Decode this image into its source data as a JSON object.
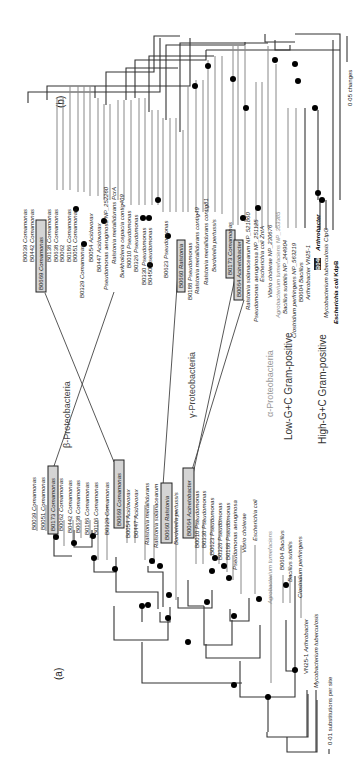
{
  "figure": {
    "panel_a_label": "(a)",
    "panel_b_label": "(b)",
    "scale_a": "0·01 substitutions per site",
    "scale_b": "0·05 changes",
    "groups": {
      "beta": "β-Proteobacteria",
      "gamma": "γ-Proteobacteria",
      "alpha": "α-Proteobacteria",
      "low_gc": "Low-G+C Gram-positive",
      "high_gc": "High-G+C Gram-positive"
    }
  },
  "tree_a": {
    "taxa": [
      {
        "id": "B0039",
        "name": "Comamonas"
      },
      {
        "id": "B0051",
        "name": "Comamonas"
      },
      {
        "id": "B0173",
        "name": "Comamonas",
        "highlight": true
      },
      {
        "id": "B0062",
        "name": "Comamonas"
      },
      {
        "id": "B0442",
        "name": "Comamonas"
      },
      {
        "id": "B0638",
        "name": "Comamonas"
      },
      {
        "id": "B0186",
        "name": "Comamonas"
      },
      {
        "id": "B0106",
        "name": "Comamonas"
      },
      {
        "id": "B0329",
        "name": "Comamonas"
      },
      {
        "id": "B0669",
        "name": "Comamonas",
        "highlight": true
      },
      {
        "id": "B0054",
        "name": "Acidovorax"
      },
      {
        "id": "B0447",
        "name": "Acidovorax"
      },
      {
        "id": "",
        "name": "Ralstonia metallidurans"
      },
      {
        "id": "",
        "name": "Ralstonia solanacearum"
      },
      {
        "id": "B0660",
        "name": "Ralstonia",
        "highlight": true
      },
      {
        "id": "",
        "name": "Bordetella pertussis"
      },
      {
        "id": "B0064",
        "name": "Acinetobacter",
        "highlight": true
      },
      {
        "id": "B0010",
        "name": "Pseudomonas"
      },
      {
        "id": "B0330",
        "name": "Pseudomonas"
      },
      {
        "id": "B0623",
        "name": "Pseudomonas"
      },
      {
        "id": "B0326",
        "name": "Pseudomonas"
      },
      {
        "id": "B0188",
        "name": "Pseudomonas"
      },
      {
        "id": "",
        "name": "Pseudomonas aeruginosa"
      },
      {
        "id": "",
        "name": "Vibrio cholerae"
      },
      {
        "id": "",
        "name": "Escherichia coli"
      },
      {
        "id": "",
        "name": "Agrobacterium tumefaciens",
        "gray": true
      },
      {
        "id": "B0604",
        "name": "Bacillus"
      },
      {
        "id": "",
        "name": "Bacillus subtilis"
      },
      {
        "id": "",
        "name": "Clostridium perfringens"
      },
      {
        "id": "VN25-1",
        "name": "Arthrobacter"
      },
      {
        "id": "",
        "name": "Mycobacterium tuberculosis"
      }
    ]
  },
  "tree_b": {
    "taxa": [
      {
        "id": "B0039",
        "name": "Comamonas"
      },
      {
        "id": "B0442",
        "name": "Comamonas"
      },
      {
        "id": "B0669",
        "name": "Comamonas",
        "highlight": true
      },
      {
        "id": "B0138",
        "name": "Comamonas"
      },
      {
        "id": "B0638",
        "name": "Comamonas"
      },
      {
        "id": "B0062",
        "name": "Comamonas"
      },
      {
        "id": "B0186",
        "name": "Comamonas"
      },
      {
        "id": "B0051",
        "name": "Comamonas"
      },
      {
        "id": "B0329",
        "name": "Comamonas"
      },
      {
        "id": "B0054",
        "name": "Acidovorax"
      },
      {
        "id": "B0447",
        "name": "Acidovorax"
      },
      {
        "id": "Pseudomonas aeruginosa",
        "name": "NP_252260"
      },
      {
        "id": "Ralstonia metallidurans",
        "name": "PcrA"
      },
      {
        "id": "Burkholderia cepacia",
        "name": "contig409"
      },
      {
        "id": "B0010",
        "name": "Pseudomonas"
      },
      {
        "id": "B0326",
        "name": "Pseudomonas"
      },
      {
        "id": "B0330",
        "name": "Pseudomonas"
      },
      {
        "id": "B0450",
        "name": "Pseudomonas"
      },
      {
        "id": "B0623",
        "name": "Pseudomonas"
      },
      {
        "id": "B0660",
        "name": "Ralstonia",
        "highlight": true
      },
      {
        "id": "B0188",
        "name": "Pseudomonas"
      },
      {
        "id": "Ralstonia metallidurans",
        "name": "contig49"
      },
      {
        "id": "Ralstonia metallidurans",
        "name": "contig81"
      },
      {
        "id": "",
        "name": "Bordetella pertussis"
      },
      {
        "id": "B0173",
        "name": "Comamonas",
        "highlight": true
      },
      {
        "id": "B0064",
        "name": "Acinetobacter",
        "highlight": true
      },
      {
        "id": "Ralstonia solanacearum",
        "name": "NP_521860"
      },
      {
        "id": "Pseudomonas aeruginosa",
        "name": "NP_251125"
      },
      {
        "id": "Escherichia coli",
        "name": "ZntA"
      },
      {
        "id": "Vibrio cholerae",
        "name": "NP_230676"
      },
      {
        "id": "Agrobacterium tumefaciens",
        "name": "NP_353385",
        "gray": true
      },
      {
        "id": "Bacillus subtilis",
        "name": "NP_244904"
      },
      {
        "id": "Clostridium perfringens",
        "name": "NP_563219"
      },
      {
        "id": "B0604",
        "name": "Bacillus"
      },
      {
        "id": "Arthrobacter",
        "name": "VN25-1"
      },
      {
        "id": "B0400",
        "name": "Arthrobacter",
        "highlight_dark": true
      },
      {
        "id": "Mycobacterium tuberculosis",
        "name": "CtpG"
      },
      {
        "id": "Escherichia coli",
        "name": "KdpB",
        "bold": true
      }
    ]
  }
}
